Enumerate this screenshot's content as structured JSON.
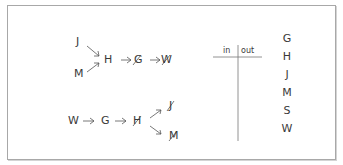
{
  "diagram": {
    "top_chain": {
      "inputs": [
        "J",
        "M"
      ],
      "hub": "H",
      "sequence": [
        "G",
        "W"
      ],
      "crossed_out": [
        "G",
        "W"
      ]
    },
    "bottom_chain": {
      "sequence": [
        "W",
        "G",
        "H"
      ],
      "outputs": [
        "J",
        "M"
      ],
      "crossed_out": [
        "H",
        "J",
        "M"
      ]
    },
    "t_chart": {
      "in_label": "in",
      "out_label": "out"
    },
    "letter_column": [
      "G",
      "H",
      "J",
      "M",
      "S",
      "W"
    ]
  }
}
